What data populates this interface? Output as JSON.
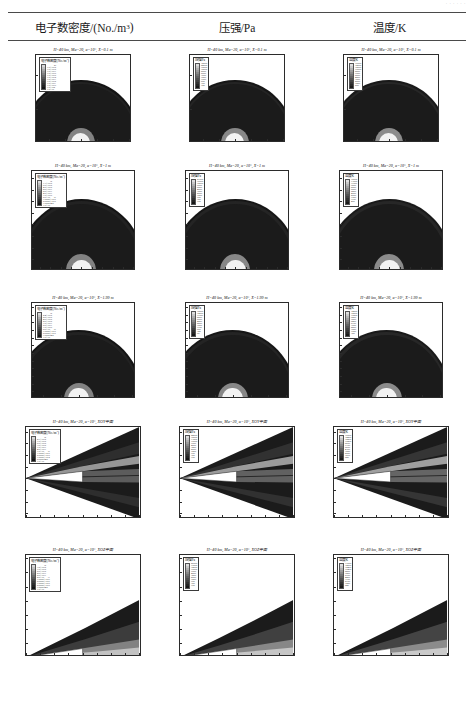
{
  "header": {
    "top_note": "· · · · · ·",
    "columns": [
      {
        "name": "electron-number-density",
        "label": "电子数密度/(No./m",
        "sup": "3",
        "tail": ")"
      },
      {
        "name": "pressure",
        "label": "压强/Pa",
        "sup": "",
        "tail": ""
      },
      {
        "name": "temperature",
        "label": "温度/K",
        "sup": "",
        "tail": ""
      }
    ]
  },
  "common": {
    "condition_prefix": "H=40 km, Ma=20, α=10°, ",
    "legend_titles": {
      "ne": "电子数密度/(No./m",
      "ne_sup": "3",
      "ne_tail": ")",
      "p": "压强/Pa",
      "t": "温度/K"
    }
  },
  "legend_values": {
    "ne_row1": [
      "1.0E+20",
      "1.0E+19",
      "1.0E+18",
      "1.0E+17",
      "1.0E+16",
      "1.0E+15",
      "1.0E+14",
      "1.0E+13",
      "1.0E+12",
      "1.0E+11",
      "1.0E+10",
      "1.0E+09"
    ],
    "ne_row2": [
      "1.3E+19",
      "6.0E+18",
      "4.0E+18",
      "2.0E+18",
      "8.0E+17",
      "4.0E+17",
      "1.0E+17",
      "5.0E+16",
      "1.0000E+16",
      "5.0000E+15",
      "1.0000E+15",
      "1.0E+14"
    ],
    "ne_row3": [
      "2.4E+19",
      "8.0E+18",
      "4.0E+18",
      "2.0E+18",
      "1.0E+18",
      "5.0E+17",
      "1.0E+17",
      "5.0E+16",
      "1.0000E+16",
      "5.0000E+15",
      "1.0000E+15",
      "1.0E+14"
    ],
    "ne_row4": [
      "2.1E+19",
      "1.0E+19",
      "6.0E+18",
      "3.0E+18",
      "1.0E+18",
      "4.0E+17",
      "1.0E+17",
      "1.0000E+16",
      "5.0000E+15",
      "1.0000E+15",
      "5.0000E+14",
      "1.0E+14"
    ],
    "ne_row5": [
      "3.5E+19",
      "1.0E+19",
      "5.0E+18",
      "2.0E+18",
      "8.0E+17",
      "2.0E+17",
      "1.0000E+17",
      "5.0000E+16",
      "1.0000E+16",
      "5.0000E+15",
      "1.0000E+15",
      "1.0E+14"
    ],
    "p_row1": [
      "32000",
      "24000",
      "18000",
      "12000",
      "8000",
      "5000",
      "3000",
      "1800",
      "1000",
      "600",
      "300",
      "120"
    ],
    "p_row2": [
      "21000",
      "16000",
      "12000",
      "9000",
      "6500",
      "4500",
      "3000",
      "2000",
      "1200",
      "700",
      "350",
      "100"
    ],
    "p_row3": [
      "18000",
      "14000",
      "11000",
      "8500",
      "6000",
      "4200",
      "2800",
      "1800",
      "1100",
      "650",
      "320",
      "90"
    ],
    "p_row4": [
      "24000",
      "18000",
      "13500",
      "10000",
      "7000",
      "4800",
      "3200",
      "2000",
      "1200",
      "700",
      "350",
      "100"
    ],
    "p_row5": [
      "26000",
      "19000",
      "14000",
      "10000",
      "7000",
      "4800",
      "3200",
      "2000",
      "1200",
      "700",
      "350",
      "100"
    ],
    "t_row1": [
      "16000",
      "14000",
      "12000",
      "10000",
      "8500",
      "7000",
      "5500",
      "4200",
      "3000",
      "2000",
      "1200",
      "500"
    ],
    "t_row2": [
      "15000",
      "13000",
      "11000",
      "9500",
      "8000",
      "6500",
      "5200",
      "4000",
      "2900",
      "1900",
      "1100",
      "400"
    ],
    "t_row3": [
      "14500",
      "12500",
      "10800",
      "9200",
      "7800",
      "6400",
      "5100",
      "3900",
      "2800",
      "1850",
      "1050",
      "380"
    ],
    "t_row4": [
      "16500",
      "14200",
      "12200",
      "10200",
      "8600",
      "7100",
      "5600",
      "4300",
      "3050",
      "2050",
      "1230",
      "520"
    ],
    "t_row5": [
      "17000",
      "14500",
      "12400",
      "10400",
      "8800",
      "7200",
      "5700",
      "4400",
      "3100",
      "2100",
      "1250",
      "540"
    ]
  },
  "rows": [
    {
      "name": "slice-x-0p1",
      "condition": "X=0.1 m",
      "title_suffix": "X=0.1 m",
      "xlabel": "Y/m",
      "ylabel": "Z/m",
      "xticks": [
        "-0.2",
        "-0.1",
        "0",
        "0.1",
        "0.2",
        "0.3"
      ],
      "yticks": [
        "0",
        "0.2",
        "0.4"
      ],
      "xlim": [
        -0.28,
        0.32
      ],
      "ylim": [
        0,
        0.52
      ],
      "kind": "cross-section"
    },
    {
      "name": "slice-x-1",
      "condition": "X=1 m",
      "title_suffix": "X=1 m",
      "xlabel": "Y/m",
      "ylabel": "Z/m",
      "xticks": [
        "-0.8",
        "-0.6",
        "-0.4",
        "-0.2",
        "0",
        "0.2",
        "0.4",
        "0.6",
        "0.8",
        "1"
      ],
      "yticks": [
        "0",
        "0.2",
        "0.4",
        "0.6",
        "0.8",
        "1",
        "1.2",
        "1.4",
        "1.6"
      ],
      "xlim": [
        -0.95,
        1.05
      ],
      "ylim": [
        0,
        1.72
      ],
      "kind": "cross-section"
    },
    {
      "name": "slice-x-1p99",
      "condition": "X=1.99 m",
      "title_suffix": "X=1.99 m",
      "xlabel": "Y/m",
      "ylabel": "Z/m",
      "xticks": [
        "-1",
        "-0.5",
        "0",
        "0.5",
        "1",
        "1.5"
      ],
      "yticks": [
        "0",
        "0.2",
        "0.4",
        "0.6",
        "0.8",
        "1",
        "1.2",
        "1.4",
        "1.6",
        "1.8",
        "2",
        "2.2",
        "2.4"
      ],
      "xlim": [
        -1.3,
        1.6
      ],
      "ylim": [
        0,
        2.5
      ],
      "kind": "cross-section"
    },
    {
      "name": "plane-xoy",
      "condition": "XOY平面",
      "title_suffix": "XOY平面",
      "xlabel": "X/m",
      "ylabel": "Y/m",
      "xticks": [
        "0",
        "0.5",
        "1",
        "1.5",
        "2",
        "2.5",
        "3",
        "3.5",
        "4"
      ],
      "yticks": [
        "-1.5",
        "-1",
        "-0.5",
        "0",
        "0.5",
        "1",
        "1.5",
        "2"
      ],
      "xlim": [
        0,
        4.1
      ],
      "ylim": [
        -1.75,
        2.2
      ],
      "kind": "xoy"
    },
    {
      "name": "plane-xoz",
      "condition": "XOZ平面",
      "title_suffix": "XOZ平面",
      "xlabel": "X/m",
      "ylabel": "Z/m",
      "xticks": [
        "0",
        "0.5",
        "1",
        "1.5",
        "2",
        "2.5",
        "3",
        "3.5",
        "4"
      ],
      "yticks": [
        "0",
        "0.5",
        "1",
        "1.5",
        "2",
        "2.5",
        "3",
        "3.5"
      ],
      "xlim": [
        0,
        4.1
      ],
      "ylim": [
        0,
        3.62
      ],
      "kind": "xoz"
    }
  ],
  "palette": {
    "ne": [
      "#d9d9d9",
      "#c2c2c2",
      "#ababab",
      "#969696",
      "#828282",
      "#6e6e6e",
      "#5c5c5c",
      "#4b4b4b",
      "#3c3c3c",
      "#2e2e2e",
      "#222222",
      "#141414"
    ],
    "p": [
      "#dcdcdc",
      "#c6c6c6",
      "#b0b0b0",
      "#9b9b9b",
      "#878787",
      "#737373",
      "#616161",
      "#505050",
      "#404040",
      "#313131",
      "#242424",
      "#161616"
    ],
    "t": [
      "#e0e0e0",
      "#cacaca",
      "#b4b4b4",
      "#9f9f9f",
      "#8b8b8b",
      "#777777",
      "#656565",
      "#545454",
      "#444444",
      "#353535",
      "#272727",
      "#191919"
    ],
    "dark_field": "#1b1b1b",
    "outer": "#ffffff",
    "axis": "#2b2b2b"
  }
}
